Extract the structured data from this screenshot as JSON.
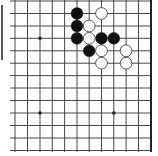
{
  "board": {
    "type": "go-diagram",
    "columns_x": [
      15,
      27.5,
      40,
      52.3,
      64.6,
      77,
      89.2,
      101.5,
      113.8,
      126.1,
      138.5
    ],
    "rows_y": [
      1,
      13.5,
      26,
      38.3,
      50.8,
      63.2,
      75.6,
      88,
      100.5,
      113,
      125.5,
      138,
      150.5
    ],
    "right_edge_x": 151,
    "line_left_start_x": 10,
    "line_bottom_end_y": 152,
    "line_color": "#333333",
    "edge_color": "#222222",
    "star_points": [
      {
        "col": 2,
        "row": 3
      },
      {
        "col": 2,
        "row": 9
      },
      {
        "col": 8,
        "row": 9
      }
    ],
    "stones": [
      {
        "color": "black",
        "col": 5,
        "row": 1
      },
      {
        "color": "black",
        "col": 5,
        "row": 2
      },
      {
        "color": "black",
        "col": 5,
        "row": 3
      },
      {
        "color": "black",
        "col": 7,
        "row": 3
      },
      {
        "color": "black",
        "col": 8,
        "row": 3
      },
      {
        "color": "black",
        "col": 6,
        "row": 4
      },
      {
        "color": "white",
        "col": 7,
        "row": 1
      },
      {
        "color": "white",
        "col": 6,
        "row": 2
      },
      {
        "color": "white",
        "col": 6,
        "row": 3
      },
      {
        "color": "white",
        "col": 7,
        "row": 4
      },
      {
        "color": "white",
        "col": 9,
        "row": 4
      },
      {
        "color": "white",
        "col": 7,
        "row": 5
      },
      {
        "color": "white",
        "col": 9,
        "row": 5
      }
    ]
  }
}
